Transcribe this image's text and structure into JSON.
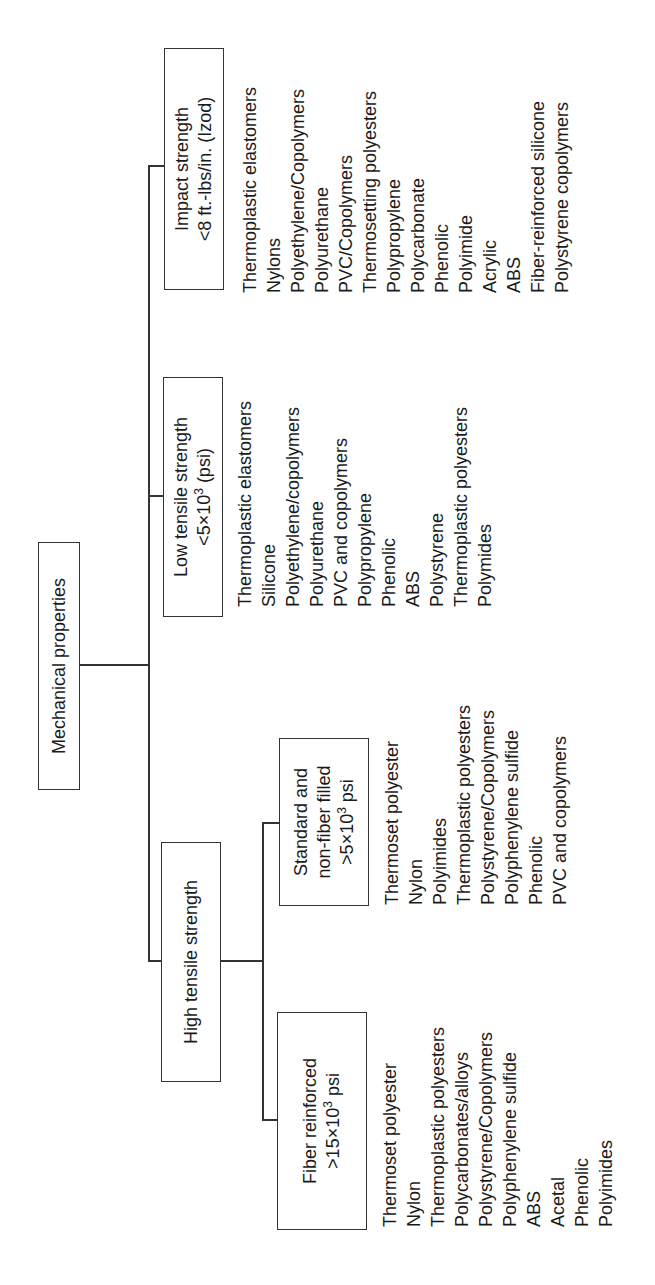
{
  "root": {
    "label": "Mechanical properties"
  },
  "high": {
    "label": "High tensile strength"
  },
  "categories": {
    "impact": {
      "line1": "Impact strength",
      "line2": "<8 ft.-lbs/in. (Izod)",
      "items": [
        "Thermoplastic elastomers",
        "Nylons",
        "Polyethylene/Copolymers",
        "Polyurethane",
        "PVC/Copolymers",
        "Thermosetting polyesters",
        "Polypropylene",
        "Polycarbonate",
        "Phenolic",
        "Polyimide",
        "Acrylic",
        "ABS",
        "Fiber-reinforced silicone",
        "Polystyrene copolymers"
      ]
    },
    "low": {
      "line1": "Low tensile strength",
      "line2_pre": "<5×10",
      "line2_sup": "3",
      "line2_post": " (psi)",
      "items": [
        "Thermoplastic elastomers",
        "Silicone",
        "Polyethylene/copolymers",
        "Polyurethane",
        "PVC and copolymers",
        "Polypropylene",
        "Phenolic",
        "ABS",
        "Polystyrene",
        "Thermoplastic polyesters",
        "Polymides"
      ]
    },
    "standard": {
      "line1": "Standard and",
      "line2": "non-fiber filled",
      "line3_pre": ">5×10",
      "line3_sup": "3",
      "line3_post": " psi",
      "items": [
        "Thermoset polyester",
        "Nylon",
        "Polyimides",
        "Thermoplastic polyesters",
        "Polystyrene/Copolymers",
        "Polyphenylene sulfide",
        "Phenolic",
        "PVC and copolymers"
      ]
    },
    "fiber": {
      "line1": "Fiber reinforced",
      "line2_pre": ">15×10",
      "line2_sup": "3",
      "line2_post": " psi",
      "items": [
        "Thermoset polyester",
        "Nylon",
        "Thermoplastic polyesters",
        "Polycarbonates/alloys",
        "Polystyrene/Copolymers",
        "Polyphenylene sulfide",
        "ABS",
        "Acetal",
        "Phenolic",
        "Polyimides"
      ]
    }
  },
  "colors": {
    "line": "#333333",
    "text": "#1a1a1a",
    "background": "#ffffff"
  }
}
